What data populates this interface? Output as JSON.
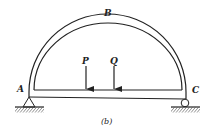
{
  "diagram": {
    "caption": "(b)",
    "labels": {
      "A": "A",
      "B": "B",
      "C": "C",
      "P": "P",
      "Q": "Q"
    },
    "supports": {
      "A": "pin",
      "C": "roller"
    },
    "loads": [
      {
        "name": "P",
        "direction": "down"
      },
      {
        "name": "Q",
        "direction": "down"
      }
    ],
    "stroke_color": "#222222"
  }
}
